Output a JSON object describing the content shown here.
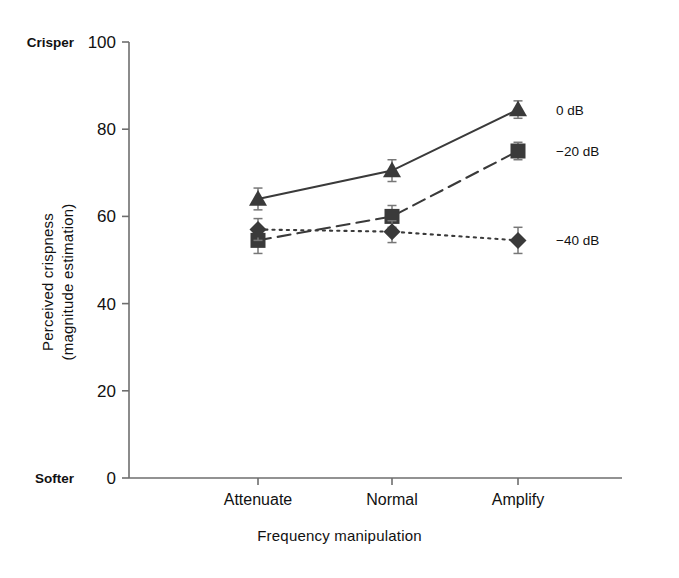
{
  "chart_data": {
    "type": "line",
    "title": "",
    "xlabel": "Frequency manipulation",
    "ylabel": "Perceived crispness (magnitude estimation)",
    "ylabel_line1": "Perceived crispness",
    "ylabel_line2": "(magnitude estimation)",
    "categories": [
      "Attenuate",
      "Normal",
      "Amplify"
    ],
    "ylim": [
      0,
      100
    ],
    "yticks": [
      0,
      20,
      40,
      60,
      80,
      100
    ],
    "ytick_labels": [
      "0",
      "20",
      "40",
      "60",
      "80",
      "100"
    ],
    "y_axis_high_label": "Crisper",
    "y_axis_low_label": "Softer",
    "grid": false,
    "legend_position": "right-of-last-point",
    "series": [
      {
        "name": "0 dB",
        "marker": "triangle",
        "line_style": "solid",
        "color": "#3a3a3a",
        "values": [
          64.0,
          70.5,
          84.5
        ],
        "errors": [
          2.5,
          2.5,
          2.0
        ]
      },
      {
        "name": "−20 dB",
        "marker": "square",
        "line_style": "dashed",
        "color": "#3a3a3a",
        "values": [
          54.5,
          60.0,
          75.0
        ],
        "errors": [
          3.0,
          2.5,
          2.0
        ]
      },
      {
        "name": "−40 dB",
        "marker": "diamond",
        "line_style": "dotted",
        "color": "#3a3a3a",
        "values": [
          57.0,
          56.5,
          54.5
        ],
        "errors": [
          2.5,
          2.5,
          3.0
        ]
      }
    ]
  }
}
